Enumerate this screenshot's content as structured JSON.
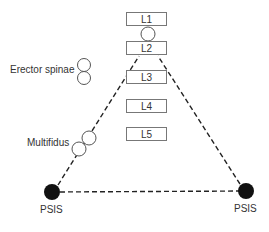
{
  "diagram": {
    "vertebrae": [
      {
        "label": "L1"
      },
      {
        "label": "L2"
      },
      {
        "label": "L3"
      },
      {
        "label": "L4"
      },
      {
        "label": "L5"
      }
    ],
    "muscles": {
      "erector_spinae": "Erector spinae",
      "multifidus": "Multifidus"
    },
    "landmarks": {
      "left": "PSIS",
      "right": "PSIS"
    },
    "colors": {
      "line": "#222222",
      "box_border": "#777777",
      "dot": "#111111"
    }
  }
}
